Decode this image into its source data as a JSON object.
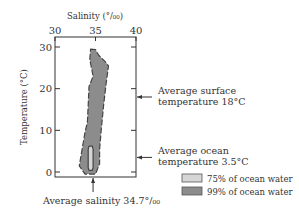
{
  "chart_data": {
    "type": "area",
    "title": "",
    "xlabel": "Salinity (‰)",
    "xlabel_display": "Salinity (°/₀₀)",
    "ylabel": "Temperature (°C)",
    "xlim": [
      30,
      40
    ],
    "ylim": [
      0,
      30
    ],
    "x_ticks": [
      30,
      35,
      40
    ],
    "x_tick_labels": [
      "30",
      "35",
      "40"
    ],
    "y_ticks": [
      0,
      10,
      20,
      30
    ],
    "y_tick_labels": [
      "0",
      "10",
      "20",
      "30"
    ],
    "grid": false,
    "series": [
      {
        "name": "99% of ocean water",
        "color": "#8c8c8c",
        "outline": "dashed",
        "polygon": [
          [
            34.4,
            29.5
          ],
          [
            35.0,
            29.4
          ],
          [
            35.4,
            28.0
          ],
          [
            36.2,
            26.5
          ],
          [
            36.6,
            25.5
          ],
          [
            36.3,
            21.0
          ],
          [
            36.0,
            16.0
          ],
          [
            35.7,
            10.0
          ],
          [
            35.5,
            5.5
          ],
          [
            35.5,
            2.0
          ],
          [
            35.0,
            -0.5
          ],
          [
            33.7,
            -0.5
          ],
          [
            33.0,
            1.5
          ],
          [
            33.4,
            6.0
          ],
          [
            33.7,
            9.5
          ],
          [
            34.0,
            12.0
          ],
          [
            34.1,
            16.0
          ],
          [
            34.2,
            20.5
          ],
          [
            34.7,
            23.0
          ],
          [
            34.3,
            27.0
          ]
        ]
      },
      {
        "name": "75% of ocean water",
        "color": "#d6d6d6",
        "outline": "solid",
        "polygon": [
          [
            34.2,
            6.2
          ],
          [
            34.6,
            6.2
          ],
          [
            34.7,
            5.5
          ],
          [
            34.7,
            1.0
          ],
          [
            34.6,
            0.4
          ],
          [
            34.2,
            0.4
          ],
          [
            34.1,
            1.0
          ],
          [
            34.1,
            5.5
          ]
        ]
      }
    ],
    "annotations": [
      {
        "id": "surface",
        "lines": [
          "Average surface",
          "temperature 18°C"
        ],
        "axis": "y",
        "value": 18,
        "side": "right"
      },
      {
        "id": "ocean",
        "lines": [
          "Average ocean",
          "temperature 3.5°C"
        ],
        "axis": "y",
        "value": 3.5,
        "side": "right"
      },
      {
        "id": "salinity",
        "lines": [
          "Average salinity 34.7°/₀₀"
        ],
        "axis": "x",
        "value": 34.7,
        "side": "bottom"
      }
    ],
    "legend": {
      "placement": "bottom-right",
      "entries": [
        {
          "label": "75% of ocean water",
          "color": "#d6d6d6"
        },
        {
          "label": "99% of ocean water",
          "color": "#8c8c8c"
        }
      ]
    }
  }
}
